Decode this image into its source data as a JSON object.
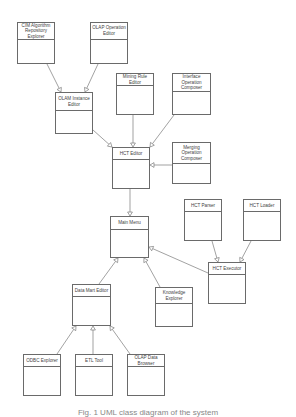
{
  "diagram": {
    "type": "uml-class-diagram",
    "classes": [
      {
        "id": "cim_repo",
        "label": "CIM Algorithm Repository Explorer",
        "x": 17,
        "y": 22,
        "w": 38,
        "h": 42,
        "hh": 17
      },
      {
        "id": "olap_op",
        "label": "OLAP Operation Editor",
        "x": 90,
        "y": 22,
        "w": 38,
        "h": 42,
        "hh": 17
      },
      {
        "id": "olam_inst",
        "label": "OLAM Instance Editor",
        "x": 55,
        "y": 92,
        "w": 38,
        "h": 42,
        "hh": 18
      },
      {
        "id": "mining_rule",
        "label": "Mining Rule Editor",
        "x": 116,
        "y": 73,
        "w": 38,
        "h": 42,
        "hh": 12
      },
      {
        "id": "iface_op",
        "label": "Interface Operation Composer",
        "x": 172,
        "y": 73,
        "w": 39,
        "h": 42,
        "hh": 18
      },
      {
        "id": "hct_editor",
        "label": "HCT Editor",
        "x": 112,
        "y": 147,
        "w": 38,
        "h": 42,
        "hh": 12
      },
      {
        "id": "merge_op",
        "label": "Merging Operation Composer",
        "x": 172,
        "y": 142,
        "w": 39,
        "h": 42,
        "hh": 21
      },
      {
        "id": "main_menu",
        "label": "Main Menu",
        "x": 110,
        "y": 216,
        "w": 39,
        "h": 42,
        "hh": 13
      },
      {
        "id": "hct_parser",
        "label": "HCT Parser",
        "x": 184,
        "y": 199,
        "w": 38,
        "h": 42,
        "hh": 12
      },
      {
        "id": "hct_loader",
        "label": "HCT Loader",
        "x": 243,
        "y": 199,
        "w": 38,
        "h": 42,
        "hh": 12
      },
      {
        "id": "hct_exec",
        "label": "HCT Executor",
        "x": 208,
        "y": 262,
        "w": 38,
        "h": 42,
        "hh": 12
      },
      {
        "id": "data_mart",
        "label": "Data Mart Editor",
        "x": 72,
        "y": 284,
        "w": 39,
        "h": 42,
        "hh": 12
      },
      {
        "id": "knowledge",
        "label": "Knowledge Explorer",
        "x": 155,
        "y": 287,
        "w": 38,
        "h": 40,
        "hh": 16
      },
      {
        "id": "odbc",
        "label": "ODBC Explorer",
        "x": 23,
        "y": 354,
        "w": 38,
        "h": 42,
        "hh": 12
      },
      {
        "id": "etl",
        "label": "ETL Tool",
        "x": 75,
        "y": 354,
        "w": 38,
        "h": 42,
        "hh": 12
      },
      {
        "id": "olap_browser",
        "label": "OLAP Data Browser",
        "x": 127,
        "y": 354,
        "w": 38,
        "h": 42,
        "hh": 12
      }
    ],
    "edges": [
      {
        "from": "cim_repo",
        "to": "olam_inst",
        "x1": 47,
        "y1": 64,
        "x2": 61,
        "y2": 92
      },
      {
        "from": "olap_op",
        "to": "olam_inst",
        "x1": 98,
        "y1": 64,
        "x2": 85,
        "y2": 92
      },
      {
        "from": "olam_inst",
        "to": "hct_editor",
        "x1": 93,
        "y1": 130,
        "x2": 112,
        "y2": 147
      },
      {
        "from": "mining_rule",
        "to": "hct_editor",
        "x1": 133,
        "y1": 115,
        "x2": 133,
        "y2": 147
      },
      {
        "from": "iface_op",
        "to": "hct_editor",
        "x1": 174,
        "y1": 115,
        "x2": 150,
        "y2": 147
      },
      {
        "from": "merge_op",
        "to": "hct_editor",
        "x1": 172,
        "y1": 165,
        "x2": 150,
        "y2": 165
      },
      {
        "from": "hct_editor",
        "to": "main_menu",
        "x1": 130,
        "y1": 189,
        "x2": 130,
        "y2": 216
      },
      {
        "from": "hct_parser",
        "to": "hct_exec",
        "x1": 212,
        "y1": 241,
        "x2": 218,
        "y2": 262
      },
      {
        "from": "hct_loader",
        "to": "hct_exec",
        "x1": 251,
        "y1": 241,
        "x2": 240,
        "y2": 262
      },
      {
        "from": "hct_exec",
        "to": "main_menu",
        "x1": 208,
        "y1": 273,
        "x2": 149,
        "y2": 247
      },
      {
        "from": "data_mart",
        "to": "main_menu",
        "x1": 99,
        "y1": 284,
        "x2": 118,
        "y2": 258
      },
      {
        "from": "knowledge",
        "to": "main_menu",
        "x1": 160,
        "y1": 287,
        "x2": 144,
        "y2": 258
      },
      {
        "from": "odbc",
        "to": "data_mart",
        "x1": 57,
        "y1": 354,
        "x2": 76,
        "y2": 326
      },
      {
        "from": "etl",
        "to": "data_mart",
        "x1": 93,
        "y1": 354,
        "x2": 93,
        "y2": 326
      },
      {
        "from": "olap_browser",
        "to": "data_mart",
        "x1": 130,
        "y1": 354,
        "x2": 110,
        "y2": 326
      }
    ],
    "line_color": "#7a7a7a"
  },
  "caption": "Fig. 1 UML class diagram of the system"
}
